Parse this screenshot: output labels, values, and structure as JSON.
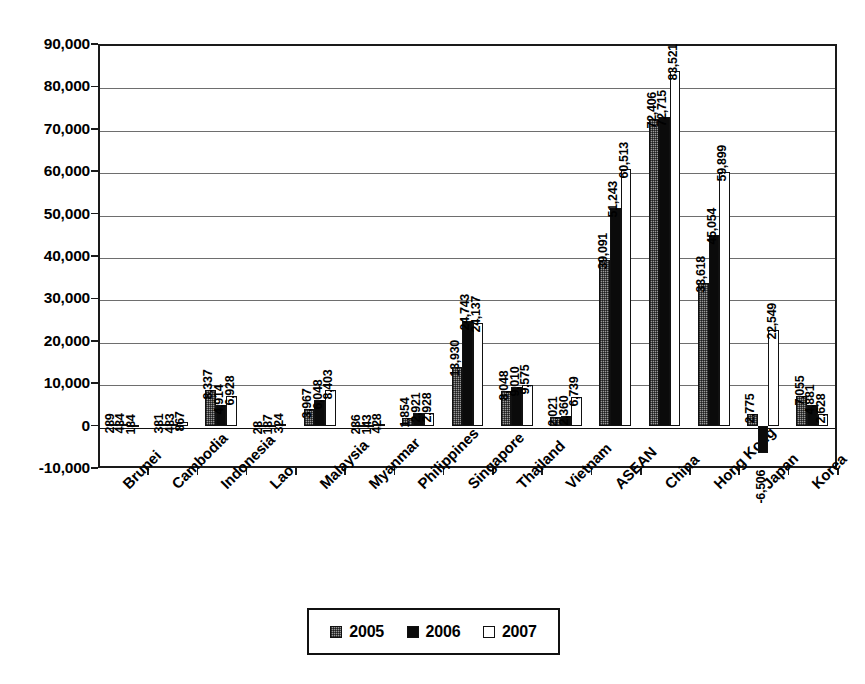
{
  "chart_data": {
    "type": "bar",
    "title": "",
    "subtitle": "",
    "xlabel": "",
    "ylabel": "",
    "ylim": [
      -10000,
      90000
    ],
    "ytick_step": 10000,
    "ytick_labels": [
      "90,000",
      "80,000",
      "70,000",
      "60,000",
      "50,000",
      "40,000",
      "30,000",
      "20,000",
      "10,000",
      "0",
      "-10,000"
    ],
    "grid": true,
    "legend_position": "bottom-center",
    "categories": [
      "Brunei",
      "Cambodia",
      "Indonesia",
      "Lao",
      "Malaysia",
      "Myanmar",
      "Philippines",
      "Singapore",
      "Thailand",
      "Vietnam",
      "ASEAN",
      "China",
      "Hong Kong",
      "Japan",
      "Korea"
    ],
    "series": [
      {
        "name": "2005",
        "color": "#9a9a9a",
        "values": [
          289,
          381,
          8337,
          28,
          3967,
          236,
          1854,
          13930,
          8048,
          2021,
          39091,
          72406,
          33618,
          2775,
          7055
        ],
        "labels": [
          "289",
          "381",
          "8,337",
          "28",
          "3,967",
          "236",
          "1,854",
          "13,930",
          "8,048",
          "2,021",
          "39,091",
          "72,406",
          "33,618",
          "2,775",
          "7,055"
        ]
      },
      {
        "name": "2006",
        "color": "#0b0b0b",
        "values": [
          434,
          483,
          4914,
          187,
          6048,
          143,
          2921,
          24743,
          9010,
          2360,
          51243,
          72715,
          45054,
          -6506,
          4881
        ],
        "labels": [
          "434",
          "483",
          "4,914",
          "187",
          "6,048",
          "143",
          "2,921",
          "24,743",
          "9,010",
          "2,360",
          "51,243",
          "72,715",
          "45,054",
          "-6,506",
          "4,881"
        ]
      },
      {
        "name": "2007",
        "color": "#ffffff",
        "values": [
          184,
          867,
          6928,
          324,
          8403,
          428,
          2928,
          24137,
          9575,
          6739,
          60513,
          83521,
          59899,
          22549,
          2628
        ],
        "labels": [
          "184",
          "867",
          "6,928",
          "324",
          "8,403",
          "428",
          "2,928",
          "24,137",
          "9,575",
          "6,739",
          "60,513",
          "83,521",
          "59,899",
          "22,549",
          "2,628"
        ]
      }
    ]
  },
  "legend": {
    "items": [
      {
        "label": "2005",
        "swatch": "gray-dotted-swatch"
      },
      {
        "label": "2006",
        "swatch": "black-solid-swatch"
      },
      {
        "label": "2007",
        "swatch": "white-outline-swatch"
      }
    ]
  }
}
